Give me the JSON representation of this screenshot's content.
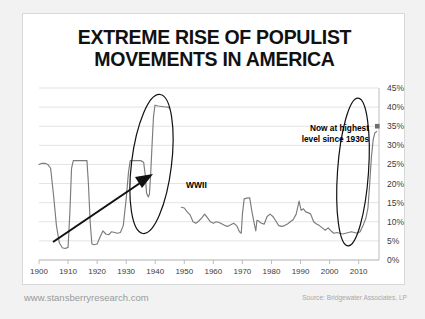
{
  "title": {
    "line1": "EXTREME RISE OF POPULIST",
    "line2": "MOVEMENTS IN AMERICA"
  },
  "footer": {
    "website": "www.stansberryresearch.com",
    "source": "Source: Bridgewater Associates, LP"
  },
  "annotations": {
    "now_line1": "Now at highest",
    "now_line2": "level since 1930s",
    "wwii": "WWII"
  },
  "colors": {
    "line": "#7b7b7b",
    "grid": "#e3e3e3",
    "axis": "#b5b5b5",
    "text": "#3b3b3b",
    "annotation": "#000000",
    "card_bg": "#ffffff",
    "page_bg": "#f2f2f2"
  },
  "chart_data": {
    "type": "line",
    "title": "EXTREME RISE OF POPULIST MOVEMENTS IN AMERICA",
    "xlabel": "",
    "ylabel": "",
    "xlim": [
      1900,
      2017
    ],
    "ylim": [
      0,
      45
    ],
    "yticks": [
      "0%",
      "5%",
      "10%",
      "15%",
      "20%",
      "25%",
      "30%",
      "35%",
      "40%",
      "45%"
    ],
    "ytick_values": [
      0,
      5,
      10,
      15,
      20,
      25,
      30,
      35,
      40,
      45
    ],
    "xticks": [
      "1900",
      "1910",
      "1920",
      "1930",
      "1940",
      "1950",
      "1960",
      "1970",
      "1980",
      "1990",
      "2000",
      "2010"
    ],
    "xtick_values": [
      1900,
      1910,
      1920,
      1930,
      1940,
      1950,
      1960,
      1970,
      1980,
      1990,
      2000,
      2010
    ],
    "grid": true,
    "legend": null,
    "series": [
      {
        "name": "Populist share of vote in developed world",
        "color": "#7b7b7b",
        "segments": [
          {
            "name": "1900-1945",
            "points": [
              [
                1900.0,
                25.0
              ],
              [
                1901.0,
                25.3
              ],
              [
                1902.0,
                25.3
              ],
              [
                1903.0,
                25.0
              ],
              [
                1904.0,
                24.0
              ],
              [
                1905.0,
                17.0
              ],
              [
                1906.0,
                9.0
              ],
              [
                1907.0,
                4.5
              ],
              [
                1908.0,
                3.2
              ],
              [
                1909.0,
                3.0
              ],
              [
                1910.0,
                3.3
              ],
              [
                1910.6,
                12.0
              ],
              [
                1911.2,
                24.0
              ],
              [
                1911.8,
                26.0
              ],
              [
                1913.0,
                26.0
              ],
              [
                1915.0,
                26.0
              ],
              [
                1916.5,
                26.0
              ],
              [
                1917.0,
                20.0
              ],
              [
                1917.6,
                10.0
              ],
              [
                1918.2,
                4.2
              ],
              [
                1919.0,
                4.0
              ],
              [
                1920.0,
                4.2
              ],
              [
                1921.0,
                6.0
              ],
              [
                1922.0,
                7.6
              ],
              [
                1923.0,
                6.8
              ],
              [
                1924.0,
                6.6
              ],
              [
                1925.0,
                7.4
              ],
              [
                1926.0,
                7.2
              ],
              [
                1927.0,
                7.0
              ],
              [
                1928.0,
                7.2
              ],
              [
                1929.0,
                9.0
              ],
              [
                1930.0,
                16.0
              ],
              [
                1930.8,
                23.0
              ],
              [
                1931.4,
                26.0
              ],
              [
                1933.0,
                26.0
              ],
              [
                1935.0,
                26.0
              ],
              [
                1936.0,
                25.6
              ],
              [
                1936.6,
                22.0
              ],
              [
                1937.0,
                17.5
              ],
              [
                1937.6,
                16.5
              ],
              [
                1938.0,
                17.2
              ],
              [
                1938.4,
                22.0
              ],
              [
                1938.9,
                30.0
              ],
              [
                1939.4,
                37.5
              ],
              [
                1939.9,
                40.5
              ],
              [
                1941.0,
                40.3
              ],
              [
                1943.0,
                40.1
              ],
              [
                1944.5,
                40.0
              ],
              [
                1945.0,
                39.6
              ]
            ]
          },
          {
            "name": "1949-2017",
            "points": [
              [
                1949.0,
                13.8
              ],
              [
                1950.0,
                13.6
              ],
              [
                1951.0,
                12.6
              ],
              [
                1952.0,
                11.8
              ],
              [
                1953.0,
                10.0
              ],
              [
                1954.0,
                9.6
              ],
              [
                1955.0,
                10.2
              ],
              [
                1956.0,
                11.0
              ],
              [
                1957.0,
                12.0
              ],
              [
                1958.0,
                11.0
              ],
              [
                1959.0,
                10.0
              ],
              [
                1960.0,
                9.6
              ],
              [
                1961.0,
                10.0
              ],
              [
                1962.0,
                9.8
              ],
              [
                1963.0,
                9.4
              ],
              [
                1964.0,
                9.0
              ],
              [
                1965.0,
                8.8
              ],
              [
                1966.0,
                9.2
              ],
              [
                1967.0,
                9.6
              ],
              [
                1968.0,
                9.0
              ],
              [
                1969.0,
                7.4
              ],
              [
                1969.6,
                7.0
              ],
              [
                1970.0,
                12.0
              ],
              [
                1970.6,
                16.0
              ],
              [
                1971.5,
                16.2
              ],
              [
                1972.5,
                16.3
              ],
              [
                1973.2,
                13.0
              ],
              [
                1974.0,
                9.8
              ],
              [
                1974.6,
                7.6
              ],
              [
                1975.0,
                10.4
              ],
              [
                1975.6,
                10.2
              ],
              [
                1976.5,
                9.6
              ],
              [
                1977.5,
                9.4
              ],
              [
                1978.5,
                11.4
              ],
              [
                1979.5,
                12.0
              ],
              [
                1980.5,
                11.4
              ],
              [
                1981.5,
                10.2
              ],
              [
                1982.5,
                9.0
              ],
              [
                1983.5,
                8.8
              ],
              [
                1984.5,
                9.0
              ],
              [
                1985.5,
                9.4
              ],
              [
                1986.5,
                10.0
              ],
              [
                1987.5,
                10.6
              ],
              [
                1988.5,
                12.0
              ],
              [
                1989.5,
                15.4
              ],
              [
                1990.2,
                13.0
              ],
              [
                1991.0,
                13.4
              ],
              [
                1991.8,
                12.6
              ],
              [
                1992.5,
                12.4
              ],
              [
                1993.5,
                12.0
              ],
              [
                1994.5,
                10.0
              ],
              [
                1995.5,
                9.4
              ],
              [
                1996.5,
                9.0
              ],
              [
                1997.5,
                8.4
              ],
              [
                1998.5,
                7.8
              ],
              [
                1999.5,
                8.4
              ],
              [
                2000.5,
                7.6
              ],
              [
                2001.5,
                7.0
              ],
              [
                2002.5,
                7.2
              ],
              [
                2003.5,
                7.0
              ],
              [
                2004.5,
                6.8
              ],
              [
                2005.5,
                7.0
              ],
              [
                2006.5,
                7.2
              ],
              [
                2007.5,
                7.4
              ],
              [
                2008.5,
                7.2
              ],
              [
                2009.5,
                7.0
              ],
              [
                2010.5,
                7.4
              ],
              [
                2011.5,
                9.0
              ],
              [
                2012.5,
                11.0
              ],
              [
                2013.2,
                13.6
              ],
              [
                2013.8,
                20.0
              ],
              [
                2014.4,
                27.0
              ],
              [
                2015.0,
                31.5
              ],
              [
                2015.6,
                33.3
              ],
              [
                2016.2,
                33.6
              ]
            ]
          }
        ],
        "marker_points": [
          {
            "x": 2016.4,
            "y": 35.0,
            "label": "Now at highest level since 1930s"
          }
        ]
      }
    ],
    "callouts": [
      {
        "type": "ellipse",
        "label": "1930s-40s populist peak",
        "x_center": 1937.5,
        "y_center": 26.0
      },
      {
        "type": "ellipse",
        "label": "present-day populist peak",
        "x_center": 2015.3,
        "y_center": 23.0
      },
      {
        "type": "arrow",
        "label": "WWII",
        "from": [
          1922,
          7
        ],
        "to": [
          1936,
          22
        ]
      }
    ]
  }
}
